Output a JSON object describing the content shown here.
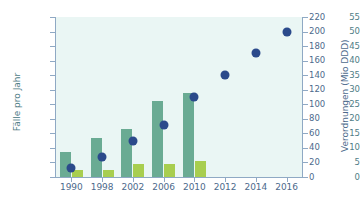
{
  "chart_data": {
    "type": "bar",
    "title": "",
    "subtitle": "",
    "categories": [
      "1990",
      "1998",
      "2002",
      "2006",
      "2010",
      "2012",
      "2014",
      "2016"
    ],
    "xlabel": "",
    "ylabel": "Fälle pro Jahr",
    "y2label": "Verordnungen (Mio DDD)",
    "ylim": [
      0,
      55
    ],
    "y2lim": [
      0,
      220
    ],
    "yticks": [
      0,
      5,
      10,
      15,
      20,
      25,
      30,
      35,
      40,
      45,
      50,
      55
    ],
    "y2ticks": [
      0,
      20,
      40,
      60,
      80,
      100,
      120,
      140,
      160,
      180,
      200,
      220
    ],
    "grid": false,
    "legend": "none",
    "series": [
      {
        "name": "Fälle pro Jahr",
        "axis": "left",
        "type": "bar",
        "color": "#6aab93",
        "values": [
          8.5,
          13.5,
          16.5,
          26,
          29,
          null,
          null,
          null
        ]
      },
      {
        "name": "Fälle pro Jahr (zweite Gruppe)",
        "axis": "left",
        "type": "bar",
        "color": "#a8ce4f",
        "values": [
          2.5,
          2.5,
          4.5,
          4.5,
          5.5,
          null,
          null,
          null
        ]
      },
      {
        "name": "Verordnungen (Mio DDD)",
        "axis": "right",
        "type": "scatter",
        "color": "#2b4a8b",
        "values": [
          12,
          28,
          50,
          72,
          110,
          140,
          170,
          200
        ]
      }
    ]
  },
  "colors": {
    "plot_background": "#eaf6f4",
    "bar_cases": "#6aab93",
    "bar_second": "#a8ce4f",
    "dot": "#2b4a8b",
    "axis": "#8fa9c4",
    "left_label": "#4f7d86",
    "right_label": "#4d6a8c"
  }
}
